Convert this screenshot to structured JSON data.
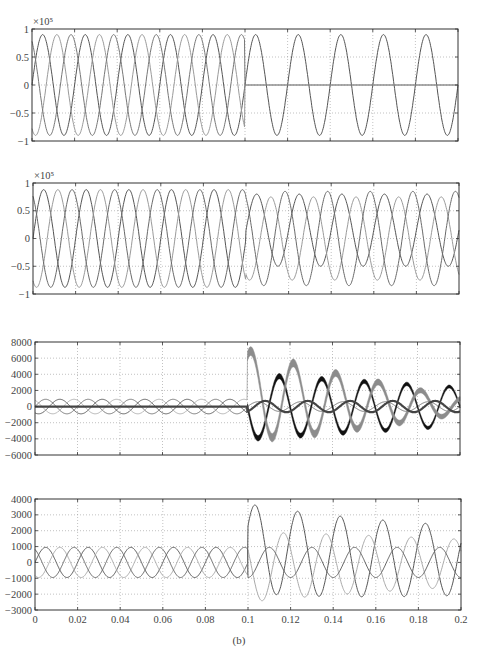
{
  "figure": {
    "caption": "(b)",
    "x_tick_labels": [
      "0",
      "0.02",
      "0.04",
      "0.06",
      "0.08",
      "0.1",
      "0.12",
      "0.14",
      "0.16",
      "0.18",
      "0.2"
    ]
  },
  "chart_data": [
    {
      "type": "line",
      "panel": 1,
      "title": "",
      "multiplier_label": "×10⁵",
      "xlabel": "",
      "ylabel": "",
      "xlim": [
        0,
        0.2
      ],
      "ylim": [
        -1,
        1
      ],
      "yticks": [
        1,
        0.5,
        0,
        -0.5,
        -1
      ],
      "ytick_labels": [
        "1",
        "0.5",
        "0",
        "-0.5",
        "-1"
      ],
      "grid": true,
      "frame": {
        "x0": 32,
        "y0": 29,
        "x1": 458,
        "y1": 141
      },
      "event_time": 0.1,
      "series": [
        {
          "name": "phase A",
          "color": "#555555",
          "pre": {
            "amp": 0.9,
            "freq": 50,
            "phase": 0
          },
          "post": {
            "amp": 0.9,
            "freq": 50,
            "phase": 0
          }
        },
        {
          "name": "phase B",
          "color": "#9a9a9a",
          "pre": {
            "amp": 0.9,
            "freq": 50,
            "phase": -120
          },
          "post": {
            "amp": 0.0,
            "freq": 50,
            "phase": -120
          }
        },
        {
          "name": "phase C",
          "color": "#777777",
          "pre": {
            "amp": 0.9,
            "freq": 50,
            "phase": 120
          },
          "post": {
            "amp": 0.0,
            "freq": 50,
            "phase": 120
          }
        }
      ],
      "notes": "After t=0.1 two phases collapse to 0, one continues at ~0.95"
    },
    {
      "type": "line",
      "panel": 2,
      "title": "",
      "multiplier_label": "×10⁵",
      "xlim": [
        0,
        0.2
      ],
      "ylim": [
        -1,
        1
      ],
      "yticks": [
        1,
        0.5,
        0,
        -0.5,
        -1
      ],
      "ytick_labels": [
        "1",
        "0.5",
        "0",
        "-0.5",
        "-1"
      ],
      "grid": true,
      "frame": {
        "x0": 33,
        "y0": 183,
        "x1": 459,
        "y1": 294
      },
      "event_time": 0.1,
      "series": [
        {
          "name": "phase A",
          "color": "#555555",
          "pre": {
            "amp": 0.88,
            "freq": 50,
            "phase": 0
          },
          "post": {
            "amp": 0.65,
            "freq": 50,
            "phase": 0,
            "offset": 0.15
          }
        },
        {
          "name": "phase B",
          "color": "#9a9a9a",
          "pre": {
            "amp": 0.88,
            "freq": 50,
            "phase": -120
          },
          "post": {
            "amp": 0.75,
            "freq": 50,
            "phase": -120
          }
        },
        {
          "name": "phase C",
          "color": "#6a6a6a",
          "pre": {
            "amp": 0.88,
            "freq": 50,
            "phase": 120
          },
          "post": {
            "amp": 0.85,
            "freq": 50,
            "phase": 120
          }
        }
      ]
    },
    {
      "type": "line",
      "panel": 3,
      "title": "",
      "xlim": [
        0,
        0.2
      ],
      "ylim": [
        -6000,
        8000
      ],
      "yticks": [
        8000,
        6000,
        4000,
        2000,
        0,
        -2000,
        -4000,
        -6000
      ],
      "ytick_labels": [
        "8000",
        "6000",
        "4000",
        "2000",
        "0",
        "-2000",
        "-4000",
        "-6000"
      ],
      "grid": true,
      "frame": {
        "x0": 35,
        "y0": 342,
        "x1": 460,
        "y1": 455
      },
      "event_time": 0.1,
      "series": [
        {
          "name": "phase A (thin)",
          "color": "#777777",
          "pre": {
            "amp": 900,
            "freq": 50,
            "phase": 0
          },
          "post": {
            "amp": 600,
            "freq": 50,
            "phase": 0
          }
        },
        {
          "name": "phase B (black band)",
          "color": "#111111",
          "pre": {
            "amp": 900,
            "freq": 50,
            "phase": -120
          },
          "post": {
            "amp_start": 4000,
            "amp_end": 2400,
            "freq": 50,
            "phase": 180,
            "band": 700
          }
        },
        {
          "name": "phase C (gray band)",
          "color": "#8c8c8c",
          "pre": {
            "amp": 900,
            "freq": 50,
            "phase": 120
          },
          "post": {
            "amp_start": 5500,
            "amp_end": 1000,
            "freq": 50,
            "phase": 60,
            "offset_start": 1500,
            "offset_end": 800,
            "band": 1100
          }
        },
        {
          "name": "mid trace",
          "color": "#444444",
          "pre": {
            "amp": 0,
            "freq": 50,
            "phase": 0
          },
          "post": {
            "amp": 700,
            "freq": 50,
            "phase": -60
          }
        }
      ]
    },
    {
      "type": "line",
      "panel": 4,
      "title": "",
      "xlim": [
        0,
        0.2
      ],
      "ylim": [
        -3000,
        4000
      ],
      "yticks": [
        4000,
        3000,
        2000,
        1000,
        0,
        -1000,
        -2000,
        -3000
      ],
      "ytick_labels": [
        "4000",
        "3000",
        "2000",
        "1000",
        "0",
        "-1000",
        "-2000",
        "-3000"
      ],
      "grid": true,
      "frame": {
        "x0": 35,
        "y0": 499,
        "x1": 461,
        "y1": 610
      },
      "event_time": 0.1,
      "series": [
        {
          "name": "phase A",
          "color": "#555555",
          "pre": {
            "amp": 950,
            "freq": 50,
            "phase": 0
          },
          "post": {
            "amp_start": 2800,
            "amp_end": 2200,
            "freq": 50,
            "phase": 30,
            "offset": 900
          }
        },
        {
          "name": "phase B",
          "color": "#aaaaaa",
          "pre": {
            "amp": 950,
            "freq": 50,
            "phase": -120
          },
          "post": {
            "amp_start": 2200,
            "amp_end": 1500,
            "freq": 50,
            "phase": 150,
            "offset": -300
          }
        },
        {
          "name": "phase C",
          "color": "#666666",
          "pre": {
            "amp": 950,
            "freq": 50,
            "phase": 120
          },
          "post": {
            "amp": 950,
            "freq": 50,
            "phase": -90
          }
        }
      ]
    }
  ]
}
